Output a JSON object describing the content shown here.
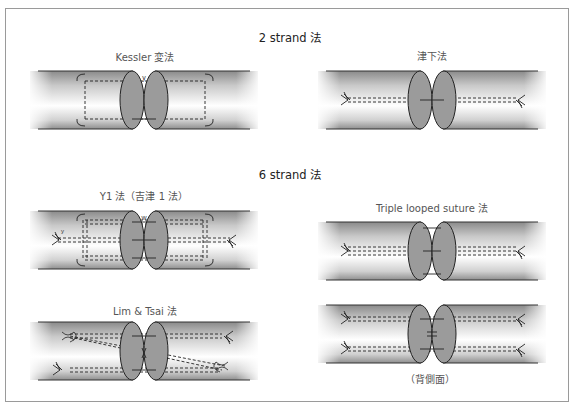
{
  "figure": {
    "sections": [
      {
        "id": "two-strand",
        "title": "2 strand 法",
        "methods": [
          {
            "id": "kessler",
            "label": "Kessler 変法",
            "knot_label": "y"
          },
          {
            "id": "tsuge",
            "label": "津下法"
          }
        ]
      },
      {
        "id": "six-strand",
        "title": "6 strand 法",
        "methods": [
          {
            "id": "y1",
            "label": "Y1 法（吉津 1 法）",
            "knot_label": "w",
            "anchor_label": "y"
          },
          {
            "id": "triple-looped",
            "label": "Triple looped suture 法"
          },
          {
            "id": "lim-tsai",
            "label": "Lim & Tsai 法"
          },
          {
            "id": "triple-looped-dorsal",
            "label": "（背側面）"
          }
        ]
      }
    ],
    "colors": {
      "frame": "#9a9a9a",
      "tube_dark": "#8c8c8c",
      "tube_light": "#ffffff",
      "cut_surface": "#9b9b9b",
      "suture": "#222222"
    }
  }
}
